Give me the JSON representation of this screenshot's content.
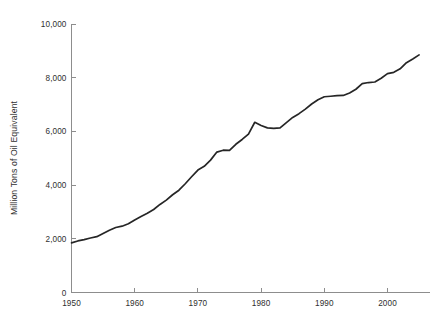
{
  "chart_data": {
    "type": "line",
    "title": "",
    "subtitle": "",
    "xlabel": "",
    "ylabel": "Million Tons of Oil Equivalent",
    "xlim": [
      1950,
      2005
    ],
    "ylim": [
      0,
      10000
    ],
    "grid": false,
    "legend": null,
    "legend_position": "none",
    "x_ticks": [
      1950,
      1960,
      1970,
      1980,
      1990,
      2000
    ],
    "x_tick_labels": [
      "1950",
      "1960",
      "1970",
      "1980",
      "1990",
      "2000"
    ],
    "y_ticks": [
      0,
      2000,
      4000,
      6000,
      8000,
      10000
    ],
    "y_tick_labels": [
      "0",
      "2,000",
      "4,000",
      "6,000",
      "8,000",
      "10,000"
    ],
    "line_color": "#262626",
    "axis_color": "#8d8d8d",
    "text_color": "#2f2f2f",
    "series": [
      {
        "name": "World Energy Consumption",
        "x": [
          1950,
          1951,
          1952,
          1953,
          1954,
          1955,
          1956,
          1957,
          1958,
          1959,
          1960,
          1961,
          1962,
          1963,
          1964,
          1965,
          1966,
          1967,
          1968,
          1969,
          1970,
          1971,
          1972,
          1973,
          1974,
          1975,
          1976,
          1977,
          1978,
          1979,
          1980,
          1981,
          1982,
          1983,
          1984,
          1985,
          1986,
          1987,
          1988,
          1989,
          1990,
          1991,
          1992,
          1993,
          1994,
          1995,
          1996,
          1997,
          1998,
          1999,
          2000,
          2001,
          2002,
          2003,
          2004,
          2005
        ],
        "values": [
          1850,
          1920,
          1970,
          2030,
          2080,
          2200,
          2320,
          2420,
          2470,
          2560,
          2700,
          2830,
          2950,
          3090,
          3280,
          3440,
          3640,
          3810,
          4050,
          4310,
          4560,
          4700,
          4930,
          5230,
          5300,
          5290,
          5520,
          5700,
          5900,
          6340,
          6220,
          6130,
          6110,
          6130,
          6330,
          6520,
          6660,
          6830,
          7020,
          7180,
          7290,
          7310,
          7330,
          7340,
          7430,
          7570,
          7780,
          7820,
          7840,
          7980,
          8150,
          8200,
          8330,
          8560,
          8700,
          8850
        ]
      }
    ]
  },
  "axis": {
    "ylabel": "Million Tons of Oil Equivalent"
  }
}
